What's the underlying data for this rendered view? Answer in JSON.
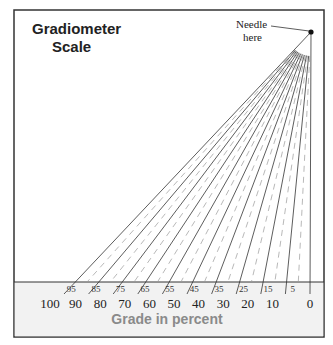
{
  "title_line1": "Gradiometer",
  "title_line2": "Scale",
  "needle_label_line1": "Needle",
  "needle_label_line2": "here",
  "axis_label": "Grade in percent",
  "major_ticks": [
    "100",
    "90",
    "80",
    "70",
    "60",
    "50",
    "40",
    "30",
    "20",
    "10",
    "0"
  ],
  "minor_ticks": [
    "95",
    "85",
    "75",
    "65",
    "55",
    "45",
    "35",
    "25",
    "15",
    "5"
  ],
  "colors": {
    "frame": "#333333",
    "band": "#f2f2f2",
    "line": "#333333",
    "dashed": "#999999",
    "axis_label": "#8a8a8a"
  }
}
